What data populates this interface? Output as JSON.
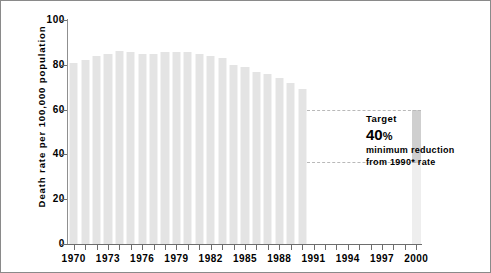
{
  "chart_data": {
    "type": "bar",
    "title": "",
    "xlabel": "",
    "ylabel": "Death rate per 100,000 population",
    "ylim": [
      0,
      100
    ],
    "ytick_labels": [
      "0",
      "20",
      "40",
      "60",
      "80",
      "100"
    ],
    "ytick_values": [
      0,
      20,
      40,
      60,
      80,
      100
    ],
    "grid": false,
    "legend_position": "none",
    "x_axis_label_step_years": 3,
    "xtick_labels": [
      "1970",
      "1973",
      "1976",
      "1979",
      "1982",
      "1985",
      "1988",
      "1991",
      "1994",
      "1997",
      "2000"
    ],
    "categories": [
      "1970",
      "1971",
      "1972",
      "1973",
      "1974",
      "1975",
      "1976",
      "1977",
      "1978",
      "1979",
      "1980",
      "1981",
      "1982",
      "1983",
      "1984",
      "1985",
      "1986",
      "1987",
      "1988",
      "1989",
      "1990",
      "1991",
      "1992",
      "1993",
      "1994",
      "1995",
      "1996",
      "1997",
      "1998",
      "1999",
      "2000"
    ],
    "series": [
      {
        "name": "Death rate per 100,000 population",
        "values": [
          81,
          82,
          84,
          85,
          86,
          85.5,
          85,
          85,
          85.5,
          85.5,
          85.5,
          85,
          84,
          83,
          80,
          79,
          77,
          76,
          74,
          72,
          69,
          null,
          null,
          null,
          null,
          null,
          null,
          null,
          null,
          null,
          null
        ]
      },
      {
        "name": "Target (40% minimum reduction from 1990 rate)",
        "values": [
          null,
          null,
          null,
          null,
          null,
          null,
          null,
          null,
          null,
          null,
          null,
          null,
          null,
          null,
          null,
          null,
          null,
          null,
          null,
          null,
          null,
          null,
          null,
          null,
          null,
          null,
          null,
          null,
          null,
          null,
          36
        ]
      }
    ],
    "annotations": [
      {
        "kind": "target-band",
        "from_category": "1991",
        "to_category": "2000",
        "upper_value": 60,
        "lower_value": 36,
        "style": "dashed-rectangle"
      }
    ],
    "baseline_value_1990": 60,
    "target_value_2000": 36,
    "target_reduction_percent": 40
  },
  "yaxis": {
    "title": "Death rate per 100,000 population",
    "ticks": [
      {
        "label": "100",
        "value": 100
      },
      {
        "label": "80",
        "value": 80
      },
      {
        "label": "60",
        "value": 60
      },
      {
        "label": "40",
        "value": 40
      },
      {
        "label": "20",
        "value": 20
      },
      {
        "label": "0",
        "value": 0
      }
    ]
  },
  "xaxis": {
    "ticks": [
      {
        "label": "1970",
        "year": 1970
      },
      {
        "label": "1973",
        "year": 1973
      },
      {
        "label": "1976",
        "year": 1976
      },
      {
        "label": "1979",
        "year": 1979
      },
      {
        "label": "1982",
        "year": 1982
      },
      {
        "label": "1985",
        "year": 1985
      },
      {
        "label": "1988",
        "year": 1988
      },
      {
        "label": "1991",
        "year": 1991
      },
      {
        "label": "1994",
        "year": 1994
      },
      {
        "label": "1997",
        "year": 1997
      },
      {
        "label": "2000",
        "year": 2000
      }
    ]
  },
  "annotation": {
    "line1": "Target",
    "line2_number": "40",
    "line2_unit": "%",
    "line3": "minimum reduction",
    "line4": "from 1990* rate"
  },
  "colors": {
    "bar_fill": "#e4e4e4",
    "bar_highlight": "#cfcfcf",
    "bar_light": "#eeeeee",
    "dashed_line": "#b9b9b9",
    "axis": "#6d6d6d",
    "text": "#000000",
    "frame": "#8a8a8a",
    "background": "#ffffff"
  }
}
